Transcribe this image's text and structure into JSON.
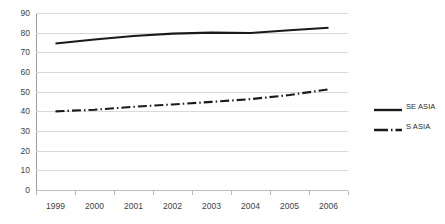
{
  "chart_data": {
    "type": "line",
    "title": "",
    "subtitle": "",
    "xlabel": "",
    "ylabel": "",
    "x": [
      "1999",
      "2000",
      "2001",
      "2002",
      "2003",
      "2004",
      "2005",
      "2006"
    ],
    "categories": [
      "1999",
      "2000",
      "2001",
      "2002",
      "2003",
      "2004",
      "2005",
      "2006"
    ],
    "series": [
      {
        "name": "SE ASIA",
        "style": "solid",
        "color": "#1a1a1a",
        "values": [
          74.5,
          76.5,
          78.3,
          79.5,
          80.0,
          79.8,
          81.2,
          82.5
        ]
      },
      {
        "name": "S ASIA",
        "style": "dash-dot",
        "color": "#1a1a1a",
        "values": [
          40.0,
          40.8,
          42.3,
          43.5,
          44.8,
          46.2,
          48.3,
          51.2
        ]
      }
    ],
    "ylim": [
      0,
      90
    ],
    "ytick_step": 10,
    "yticks": [
      "0",
      "10",
      "20",
      "30",
      "40",
      "50",
      "60",
      "70",
      "80",
      "90"
    ],
    "grid": true,
    "grid_axis": "y",
    "legend_position": "right"
  },
  "legend": {
    "items": [
      {
        "label": "SE ASIA",
        "style": "solid"
      },
      {
        "label": "S ASIA",
        "style": "dash-dot"
      }
    ]
  },
  "colors": {
    "series": "#1a1a1a",
    "gridline": "#d9d9d9",
    "axis": "#9a9a9a",
    "tick_text": "#3f3f3f",
    "background": "#ffffff"
  }
}
